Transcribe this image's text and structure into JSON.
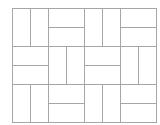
{
  "diagram": {
    "type": "basket-weave-tiling",
    "origin": [
      12,
      8
    ],
    "block_width": 36,
    "block_height": 38,
    "columns": 4,
    "rows": 3,
    "line_color": "#a6a6a6",
    "background": "#ffffff",
    "blocks": [
      [
        "vertical",
        "horizontal",
        "vertical",
        "horizontal"
      ],
      [
        "horizontal",
        "vertical",
        "horizontal",
        "vertical"
      ],
      [
        "vertical",
        "horizontal",
        "vertical",
        "horizontal"
      ]
    ]
  }
}
